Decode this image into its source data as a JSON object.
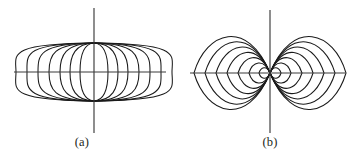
{
  "figure": {
    "kind": "two-panel-line-figure",
    "background_color": "#ffffff",
    "line_color": "#1a1a1a",
    "axis_color": "#3a3a3a",
    "width": 359,
    "height": 157
  },
  "panels": [
    {
      "id": "a",
      "caption": "(a)",
      "description": "vertical-dipole-field-lines",
      "center": {
        "x": 94,
        "y": 72
      },
      "axes": {
        "vertical": {
          "x": 94,
          "y_top": 8,
          "y_bottom": 133
        },
        "horizontal": {
          "y": 72,
          "x_left": 14,
          "x_right": 166
        }
      },
      "nodes": [
        {
          "x": 94,
          "y": 43
        },
        {
          "x": 94,
          "y": 101
        }
      ],
      "loop_half_widths": [
        14,
        24,
        34,
        45,
        56,
        67,
        78
      ],
      "loop_count_per_side": 7
    },
    {
      "id": "b",
      "caption": "(b)",
      "description": "horizontal-dipole-field-lines",
      "center": {
        "x": 91,
        "y": 73
      },
      "axes": {
        "vertical": {
          "x": 91,
          "y_top": 10,
          "y_bottom": 133
        },
        "horizontal": {
          "y": 73,
          "x_left": 11,
          "x_right": 166
        }
      },
      "nodes": [
        {
          "x": 91,
          "y": 73
        }
      ],
      "loop_half_widths": [
        11,
        21,
        32,
        43,
        54,
        65,
        76
      ],
      "loop_count_per_side": 7
    }
  ],
  "captions": {
    "a": "(a)",
    "b": "(b)"
  }
}
